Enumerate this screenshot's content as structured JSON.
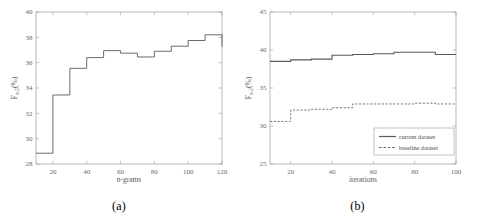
{
  "figure": {
    "panels": [
      {
        "id": "a",
        "caption": "(a)"
      },
      {
        "id": "b",
        "caption": "(b)"
      }
    ]
  },
  "chart_data": [
    {
      "type": "line",
      "panel": "a",
      "title": "",
      "xlabel": "n-grams",
      "ylabel": "F",
      "ylabel_sub": "n-2",
      "ylabel_unit": "(%)",
      "xlim": [
        10,
        120
      ],
      "ylim": [
        28,
        40
      ],
      "xticks": [
        20,
        40,
        60,
        80,
        100,
        120
      ],
      "yticks": [
        28,
        30,
        32,
        34,
        36,
        38,
        40
      ],
      "grid": false,
      "drawstyle": "steps-post",
      "legend": null,
      "x": [
        10,
        20,
        30,
        40,
        50,
        55,
        60,
        70,
        80,
        90,
        100,
        110,
        120
      ],
      "values": [
        28.85,
        33.45,
        35.55,
        36.4,
        36.95,
        36.95,
        36.75,
        36.45,
        36.9,
        37.3,
        37.75,
        38.2,
        37.25
      ],
      "series": [
        {
          "name": "F-measure",
          "style": "solid",
          "color": "#5a5a5a",
          "values": [
            28.85,
            33.45,
            35.55,
            36.4,
            36.95,
            36.95,
            36.75,
            36.45,
            36.9,
            37.3,
            37.75,
            38.2,
            37.25
          ]
        }
      ]
    },
    {
      "type": "line",
      "panel": "b",
      "title": "",
      "xlabel": "iterations",
      "ylabel": "F",
      "ylabel_sub": "n-2",
      "ylabel_unit": "(%)",
      "xlim": [
        10,
        100
      ],
      "ylim": [
        25,
        45
      ],
      "xticks": [
        20,
        40,
        60,
        80,
        100
      ],
      "yticks": [
        25,
        30,
        35,
        40,
        45
      ],
      "grid": false,
      "drawstyle": "steps-post",
      "legend": {
        "position": "lower-right",
        "entries": [
          {
            "label": "current dataset",
            "style": "solid",
            "color": "#5a5a5a"
          },
          {
            "label": "baseline dataset",
            "style": "dashed",
            "color": "#6a6a6a"
          }
        ]
      },
      "x": [
        10,
        20,
        30,
        40,
        50,
        60,
        70,
        80,
        90,
        100
      ],
      "series": [
        {
          "name": "current dataset",
          "style": "solid",
          "color": "#5a5a5a",
          "values": [
            38.5,
            38.7,
            38.8,
            39.3,
            39.4,
            39.5,
            39.7,
            39.7,
            39.4,
            39.4
          ]
        },
        {
          "name": "baseline dataset",
          "style": "dashed",
          "color": "#6a6a6a",
          "values": [
            30.6,
            32.1,
            32.2,
            32.4,
            32.9,
            32.9,
            32.9,
            33.0,
            32.9,
            32.9
          ]
        }
      ]
    }
  ]
}
